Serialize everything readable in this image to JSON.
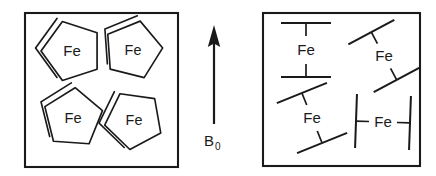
{
  "figure": {
    "background_color": "#ffffff",
    "line_color": "#1a1a1a",
    "width": 436,
    "height": 176
  },
  "field_arrow": {
    "label": "B",
    "subscript": "0",
    "direction": "up",
    "description": "external magnetic field vector"
  },
  "left_panel": {
    "name": "randomly-oriented-sample",
    "box": {
      "x": 25,
      "y": 13,
      "width": 153,
      "height": 154
    },
    "molecules": [
      {
        "id": "fe-1",
        "label": "Fe",
        "cx": 72,
        "cy": 51,
        "rotation": -18,
        "scale": 1.0,
        "view": "pentagon-face-on"
      },
      {
        "id": "fe-2",
        "label": "Fe",
        "cx": 133,
        "cy": 50,
        "rotation": 14,
        "scale": 0.96,
        "view": "pentagon-face-on"
      },
      {
        "id": "fe-3",
        "label": "Fe",
        "cx": 73,
        "cy": 118,
        "rotation": 4,
        "scale": 0.98,
        "view": "pentagon-face-on"
      },
      {
        "id": "fe-4",
        "label": "Fe",
        "cx": 134,
        "cy": 120,
        "rotation": -28,
        "scale": 0.96,
        "view": "pentagon-face-on"
      }
    ]
  },
  "right_panel": {
    "name": "aligned-sample",
    "box": {
      "x": 263,
      "y": 13,
      "width": 157,
      "height": 153
    },
    "molecules": [
      {
        "id": "fe-5",
        "label": "Fe",
        "cx": 306,
        "cy": 50,
        "rotation": 0,
        "half_gap": 27,
        "bar_half": 25,
        "view": "edge-on"
      },
      {
        "id": "fe-6",
        "label": "Fe",
        "cx": 384,
        "cy": 56,
        "rotation": -28,
        "half_gap": 27,
        "bar_half": 26,
        "view": "edge-on"
      },
      {
        "id": "fe-7",
        "label": "Fe",
        "cx": 312,
        "cy": 118,
        "rotation": -22,
        "half_gap": 27,
        "bar_half": 27,
        "view": "edge-on"
      },
      {
        "id": "fe-8",
        "label": "Fe",
        "cx": 383,
        "cy": 122,
        "rotation": 92,
        "half_gap": 27,
        "bar_half": 27,
        "view": "edge-on"
      }
    ]
  }
}
